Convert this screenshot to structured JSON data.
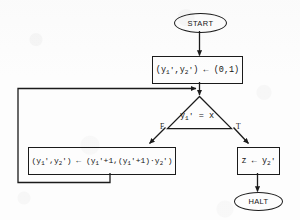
{
  "diagram": {
    "type": "flowchart",
    "nodes": [
      {
        "id": "start",
        "shape": "terminator",
        "label": "START"
      },
      {
        "id": "init",
        "shape": "process",
        "label": "(y1',y2') ← (0,1)",
        "parts": {
          "lhs_var1": "y",
          "lhs_sub1": "1",
          "lhs_var2": "y",
          "lhs_sub2": "2",
          "arrow": "←",
          "rhs": "(0,1)"
        }
      },
      {
        "id": "test",
        "shape": "decision",
        "label": "y1' = x",
        "parts": {
          "var": "y",
          "sub": "1",
          "op": "=",
          "operand": "x"
        },
        "branch_false": "F",
        "branch_true": "T"
      },
      {
        "id": "loop_body",
        "shape": "process",
        "label": "(y1',y2') ← (y1'+1,(y1'+1)·y2')"
      },
      {
        "id": "output",
        "shape": "process",
        "label": "z ← y2'",
        "parts": {
          "target": "z",
          "arrow": "←",
          "source_var": "y",
          "source_sub": "2"
        }
      },
      {
        "id": "halt",
        "shape": "terminator",
        "label": "HALT"
      }
    ],
    "edges": [
      {
        "from": "start",
        "to": "init",
        "label": ""
      },
      {
        "from": "init",
        "to": "test",
        "label": ""
      },
      {
        "from": "test",
        "to": "loop_body",
        "label": "F"
      },
      {
        "from": "test",
        "to": "output",
        "label": "T"
      },
      {
        "from": "loop_body",
        "to": "test",
        "label": ""
      },
      {
        "from": "output",
        "to": "halt",
        "label": ""
      }
    ],
    "colors": {
      "stroke": "#1b1b1b",
      "text": "#141414",
      "background": "#fdfdfd"
    }
  }
}
